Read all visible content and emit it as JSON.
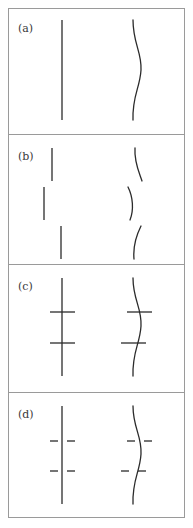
{
  "figure": {
    "title": "",
    "stroke_color": "#2b2b2b",
    "frame_color": "#9a9a9a",
    "background_color": "#ffffff",
    "frame": {
      "x": 8,
      "y": 8,
      "width": 177,
      "height": 510
    },
    "dividers_y": [
      134,
      264,
      392
    ],
    "panels": [
      {
        "id": "a",
        "label": "(a)",
        "label_x": 18,
        "label_y": 32,
        "description": "intact straight line and intact wavy line",
        "left_figure": {
          "kind": "straight-line",
          "broken": false,
          "crossbars": 0,
          "path": "M 62 20 L 62 120"
        },
        "right_figure": {
          "kind": "wavy-line",
          "broken": false,
          "crossbars": 0,
          "path": "M 133 20 C 133 44, 142 52, 141 70 C 140 88, 132 96, 133 120"
        }
      },
      {
        "id": "b",
        "label": "(b)",
        "label_x": 18,
        "label_y": 160,
        "description": "straight line and wavy line each broken into three laterally offset segments",
        "left_figure": {
          "kind": "straight-line",
          "broken": true,
          "crossbars": 0,
          "segments": [
            "M 52 148 L 52 181",
            "M 44 187 L 44 220",
            "M 61 226 L 61 259"
          ]
        },
        "right_figure": {
          "kind": "wavy-line",
          "broken": true,
          "crossbars": 0,
          "segments": [
            "M 135 148 C 134 162, 139 172, 142 181",
            "M 128 187 C 133 197, 134 210, 130 220",
            "M 141 226 C 136 236, 133 248, 134 259"
          ]
        }
      },
      {
        "id": "c",
        "label": "(c)",
        "label_x": 18,
        "label_y": 290,
        "description": "continuous lines crossed by two continuous horizontal bars",
        "left_figure": {
          "kind": "straight-line",
          "broken": false,
          "crossbars": 2,
          "path": "M 62 278 L 62 376",
          "bars": [
            "M 50 312 L 75 312",
            "M 50 343 L 75 343"
          ]
        },
        "right_figure": {
          "kind": "wavy-line",
          "broken": false,
          "crossbars": 2,
          "path": "M 133 278 C 133 300, 142 308, 141 326 C 140 344, 132 352, 133 376",
          "bars": [
            "M 127 312 L 152 312",
            "M 121 343 L 146 343"
          ]
        }
      },
      {
        "id": "d",
        "label": "(d)",
        "label_x": 18,
        "label_y": 418,
        "description": "continuous lines crossed by two broken (gapped) horizontal dash pairs",
        "left_figure": {
          "kind": "straight-line",
          "broken": false,
          "crossbars": 2,
          "crossbars_gapped": true,
          "path": "M 62 406 L 62 504",
          "bars": [
            "M 50 441 L 58 441",
            "M 67 441 L 75 441",
            "M 50 471 L 58 471",
            "M 67 471 L 75 471"
          ]
        },
        "right_figure": {
          "kind": "wavy-line",
          "broken": false,
          "crossbars": 2,
          "crossbars_gapped": true,
          "path": "M 133 406 C 133 428, 142 436, 141 454 C 140 472, 132 480, 133 504",
          "bars": [
            "M 127 441 L 135 441",
            "M 144 441 L 152 441",
            "M 121 471 L 129 471",
            "M 138 471 L 146 471"
          ]
        }
      }
    ]
  }
}
